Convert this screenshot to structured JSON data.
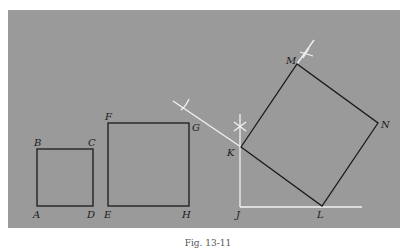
{
  "figure": {
    "caption": "Fig. 13-11",
    "background_color": "#9a9a9a",
    "line_color": "#1a1a1a",
    "construction_color": "#f2f2f2"
  },
  "square_abcd": {
    "vertices": {
      "A": [
        37,
        206
      ],
      "B": [
        37,
        149
      ],
      "C": [
        93,
        149
      ],
      "D": [
        93,
        206
      ]
    },
    "labels": {
      "A": "A",
      "B": "B",
      "C": "C",
      "D": "D"
    }
  },
  "square_efgh": {
    "vertices": {
      "E": [
        108,
        206
      ],
      "F": [
        108,
        123
      ],
      "G": [
        189,
        123
      ],
      "H": [
        189,
        206
      ]
    },
    "labels": {
      "E": "E",
      "F": "F",
      "G": "G",
      "H": "H"
    }
  },
  "square_klnm": {
    "vertices": {
      "K": [
        241,
        147
      ],
      "L": [
        322,
        206
      ],
      "N": [
        378,
        123
      ],
      "M": [
        297,
        64
      ]
    },
    "labels": {
      "K": "K",
      "L": "L",
      "M": "M",
      "N": "N"
    }
  },
  "right_angle": {
    "label": "J",
    "vertex": [
      240,
      207
    ]
  }
}
